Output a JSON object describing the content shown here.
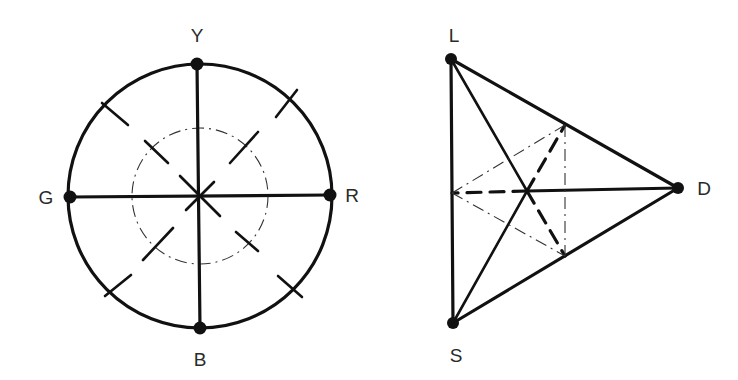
{
  "diagram": {
    "left": {
      "title": "color-circle",
      "center": [
        200,
        196
      ],
      "outer_radius": 132,
      "inner_radius": 68,
      "nodes": [
        {
          "id": "Y",
          "label": "Y",
          "x": 197,
          "y": 64,
          "label_x": 197,
          "label_y": 42
        },
        {
          "id": "R",
          "label": "R",
          "x": 330,
          "y": 195,
          "label_x": 352,
          "label_y": 202
        },
        {
          "id": "B",
          "label": "B",
          "x": 200,
          "y": 328,
          "label_x": 200,
          "label_y": 366
        },
        {
          "id": "G",
          "label": "G",
          "x": 70,
          "y": 197,
          "label_x": 46,
          "label_y": 204
        }
      ]
    },
    "right": {
      "title": "triangle-diagram",
      "nodes": [
        {
          "id": "L",
          "label": "L",
          "x": 451,
          "y": 59,
          "label_x": 454,
          "label_y": 42
        },
        {
          "id": "D",
          "label": "D",
          "x": 678,
          "y": 188,
          "label_x": 704,
          "label_y": 195
        },
        {
          "id": "S",
          "label": "S",
          "x": 453,
          "y": 323,
          "label_x": 456,
          "label_y": 362
        }
      ],
      "centroid": [
        527,
        191
      ],
      "aux_points": {
        "ld_point": [
          565,
          125
        ],
        "sd_point": [
          565,
          256
        ],
        "ls_mid": [
          452,
          193
        ]
      }
    }
  }
}
